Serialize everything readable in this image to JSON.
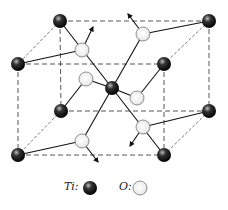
{
  "legend": [
    {
      "label": "Ti:",
      "kind": "titanium",
      "color": "#111111"
    },
    {
      "label": "O:",
      "kind": "oxygen",
      "color": "#f2f2f2"
    }
  ],
  "atoms": {
    "ti": [
      {
        "x": 60,
        "y": 21
      },
      {
        "x": 209,
        "y": 21
      },
      {
        "x": 18,
        "y": 64
      },
      {
        "x": 164,
        "y": 64
      },
      {
        "x": 61,
        "y": 111
      },
      {
        "x": 209,
        "y": 111
      },
      {
        "x": 18,
        "y": 155
      },
      {
        "x": 164,
        "y": 155
      },
      {
        "x": 112,
        "y": 88
      }
    ],
    "o": [
      {
        "x": 82,
        "y": 50
      },
      {
        "x": 143,
        "y": 34
      },
      {
        "x": 86,
        "y": 79
      },
      {
        "x": 137,
        "y": 98
      },
      {
        "x": 143,
        "y": 127
      },
      {
        "x": 82,
        "y": 141
      }
    ]
  }
}
